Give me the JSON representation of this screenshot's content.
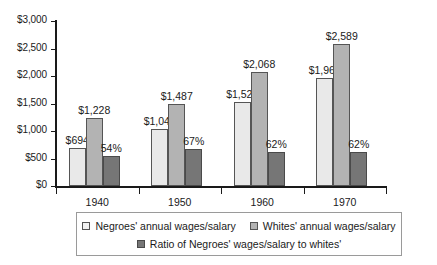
{
  "chart_data": {
    "type": "bar",
    "title": "",
    "subtitle": "",
    "xlabel": "",
    "ylabel": "",
    "categories": [
      "1940",
      "1950",
      "1960",
      "1970"
    ],
    "ylim": [
      0,
      3000
    ],
    "y_ticks": [
      0,
      500,
      1000,
      1500,
      2000,
      2500,
      3000
    ],
    "y_tick_labels": [
      "$0",
      "$500",
      "$1,000",
      "$1,500",
      "$2,000",
      "$2,500",
      "$3,000"
    ],
    "grid": false,
    "legend_position": "bottom",
    "series": [
      {
        "name": "Negroes' annual wages/salary",
        "key": "negro",
        "color": "#e9e9e9",
        "values": [
          694,
          1044,
          1523,
          1966
        ],
        "labels": [
          "$694",
          "$1,044",
          "$1,523",
          "$1,966"
        ]
      },
      {
        "name": "Whites' annual wages/salary",
        "key": "white",
        "color": "#b3b3b3",
        "values": [
          1228,
          1487,
          2068,
          2589
        ],
        "labels": [
          "$1,228",
          "$1,487",
          "$2,068",
          "$2,589"
        ]
      },
      {
        "name": "Ratio of Negroes' wages/salary to whites'",
        "key": "ratio",
        "color": "#767676",
        "values": [
          540,
          670,
          620,
          620
        ],
        "labels": [
          "54%",
          "67%",
          "62%",
          "62%"
        ]
      }
    ]
  },
  "legend": {
    "row1": [
      {
        "label": "Negroes' annual wages/salary",
        "swatch": "s-negro"
      },
      {
        "label": "Whites' annual wages/salary",
        "swatch": "s-white"
      }
    ],
    "row2": [
      {
        "label": "Ratio of Negroes' wages/salary to whites'",
        "swatch": "s-ratio"
      }
    ]
  },
  "colors": {
    "axis": "#1a1a1a",
    "text": "#1a1a1a",
    "legend_border": "#9a9a9a",
    "bar_border": "#555555",
    "background": "#ffffff"
  }
}
